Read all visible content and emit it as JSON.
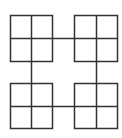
{
  "diagram": {
    "stroke_color": "#333333",
    "background": "#ffffff",
    "squares": [
      {
        "id": "top-left",
        "x": 10,
        "y": 15,
        "w": 42,
        "h": 46,
        "mid_x": 31,
        "mid_y": 38
      },
      {
        "id": "top-right",
        "x": 74,
        "y": 15,
        "w": 43,
        "h": 46,
        "mid_x": 96,
        "mid_y": 38
      },
      {
        "id": "bottom-left",
        "x": 10,
        "y": 83,
        "w": 42,
        "h": 45,
        "mid_x": 31,
        "mid_y": 106
      },
      {
        "id": "bottom-right",
        "x": 74,
        "y": 83,
        "w": 43,
        "h": 45,
        "mid_x": 96,
        "mid_y": 106
      }
    ],
    "connectors": [
      {
        "id": "top-horizontal",
        "x1": 52,
        "y1": 38,
        "x2": 74,
        "y2": 38
      },
      {
        "id": "left-vertical",
        "x1": 31,
        "y1": 61,
        "x2": 31,
        "y2": 83
      },
      {
        "id": "right-vertical",
        "x1": 96,
        "y1": 61,
        "x2": 96,
        "y2": 83
      },
      {
        "id": "bottom-horizontal",
        "x1": 52,
        "y1": 106,
        "x2": 74,
        "y2": 106
      }
    ]
  }
}
